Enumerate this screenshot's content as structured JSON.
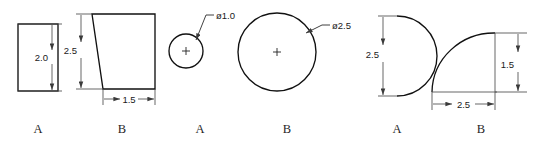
{
  "drawing": {
    "title": "Shape dimension reference figures",
    "background_color": "#ffffff",
    "line_color": "#111111",
    "dim_color": "#4d4d4d",
    "text_color": "#1a1a1a"
  },
  "figures": [
    {
      "id": "figure-1",
      "label": "A",
      "shape": "rectangle",
      "dimensions": [
        {
          "id": "rect-height",
          "value": "2.0",
          "orientation": "vertical"
        }
      ]
    },
    {
      "id": "figure-2",
      "label": "B",
      "shape": "right-triangle",
      "dimensions": [
        {
          "id": "triangle-height",
          "value": "2.5",
          "orientation": "vertical"
        },
        {
          "id": "triangle-base",
          "value": "1.5",
          "orientation": "horizontal"
        }
      ]
    },
    {
      "id": "figure-3",
      "label": "A",
      "shape": "small-circle",
      "dimensions": [
        {
          "id": "small-circle-diameter",
          "value": "ø1.0",
          "orientation": "leader"
        }
      ]
    },
    {
      "id": "figure-4",
      "label": "B",
      "shape": "large-circle",
      "dimensions": [
        {
          "id": "large-circle-diameter",
          "value": "ø2.5",
          "orientation": "leader"
        }
      ]
    },
    {
      "id": "figure-5",
      "label": "A",
      "shape": "semicircle",
      "dimensions": [
        {
          "id": "semicircle-diameter",
          "value": "2.5",
          "orientation": "vertical"
        }
      ]
    },
    {
      "id": "figure-6",
      "label": "B",
      "shape": "quarter-ellipse-arc",
      "dimensions": [
        {
          "id": "arc-width",
          "value": "2.5",
          "orientation": "horizontal"
        },
        {
          "id": "arc-height",
          "value": "1.5",
          "orientation": "vertical"
        }
      ]
    }
  ]
}
